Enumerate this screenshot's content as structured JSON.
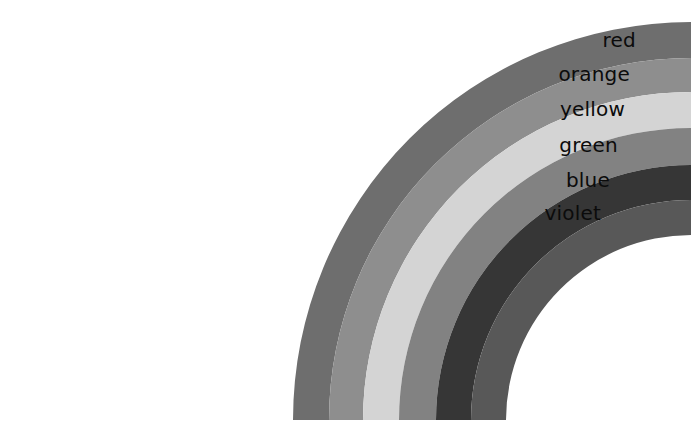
{
  "figure": {
    "background_color": "#ffffff",
    "width": 691,
    "height": 446
  },
  "geometry": {
    "center_x": 691,
    "center_y": 420,
    "start_angle_deg": 180,
    "end_angle_deg": 270
  },
  "chart_data": {
    "type": "pie",
    "categories": [
      "red",
      "orange",
      "yellow",
      "green",
      "blue",
      "violet"
    ],
    "values": [
      36,
      34,
      36,
      37,
      35,
      35
    ],
    "xlabel": "",
    "ylabel": "",
    "legend_position": "inline-right",
    "grid": false,
    "annotations": [
      "Bands ordered outermost (red) to innermost (violet)",
      "Rendered in grayscale"
    ]
  },
  "bands": [
    {
      "label": "red",
      "index": 0,
      "outer_radius": 398,
      "inner_radius": 362,
      "fill": "#6e6e6e",
      "label_x": 636,
      "label_y": 47
    },
    {
      "label": "orange",
      "index": 1,
      "outer_radius": 362,
      "inner_radius": 328,
      "fill": "#8e8e8e",
      "label_x": 630,
      "label_y": 81
    },
    {
      "label": "yellow",
      "index": 2,
      "outer_radius": 328,
      "inner_radius": 292,
      "fill": "#d4d4d4",
      "label_x": 625,
      "label_y": 116
    },
    {
      "label": "green",
      "index": 3,
      "outer_radius": 292,
      "inner_radius": 255,
      "fill": "#828282",
      "label_x": 618,
      "label_y": 152
    },
    {
      "label": "blue",
      "index": 4,
      "outer_radius": 255,
      "inner_radius": 220,
      "fill": "#363636",
      "label_x": 610,
      "label_y": 187
    },
    {
      "label": "violet",
      "index": 5,
      "outer_radius": 220,
      "inner_radius": 185,
      "fill": "#585858",
      "label_x": 601,
      "label_y": 220
    }
  ]
}
